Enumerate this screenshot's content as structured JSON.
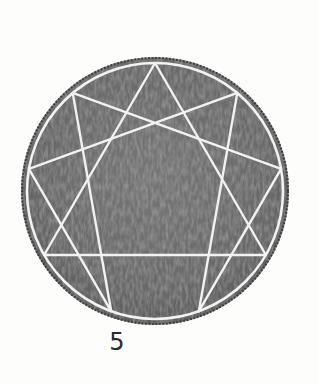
{
  "figure": {
    "type": "enneagram",
    "points": 9,
    "colors": {
      "disk_fill": "#6e6e6e",
      "disk_edge": "#3a3a3a",
      "line": "#f2f2f2",
      "background": "#fdfdfb"
    }
  },
  "caption": {
    "label": "5"
  }
}
